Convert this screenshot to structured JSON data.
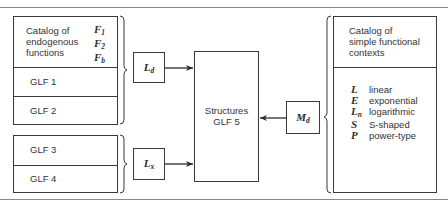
{
  "left_group_1": {
    "catalog": {
      "label_lines": [
        "Catalog of",
        "endogenous",
        "functions"
      ],
      "symbols": [
        {
          "base": "F",
          "sub": "1"
        },
        {
          "base": "F",
          "sub": "2"
        },
        {
          "base": "F",
          "sub": "b"
        }
      ]
    },
    "glf1": "GLF 1",
    "glf2": "GLF 2"
  },
  "left_group_2": {
    "glf3": "GLF 3",
    "glf4": "GLF 4"
  },
  "ld_box": {
    "base": "L",
    "sub": "d"
  },
  "lx_box": {
    "base": "L",
    "sub": "x"
  },
  "md_box": {
    "base": "M",
    "sub": "d"
  },
  "center_box": {
    "line1": "Structures",
    "line2": "GLF 5"
  },
  "right_box": {
    "title_lines": [
      "Catalog of",
      "simple functional",
      "contexts"
    ],
    "items": [
      {
        "symbol": "L",
        "sub": "",
        "label": "linear"
      },
      {
        "symbol": "E",
        "sub": "",
        "label": "exponential"
      },
      {
        "symbol": "L",
        "sub": "n",
        "label": "logarithmic"
      },
      {
        "symbol": "S",
        "sub": "",
        "label": "S-shaped"
      },
      {
        "symbol": "P",
        "sub": "",
        "label": "power-type"
      }
    ]
  },
  "colors": {
    "line": "#3a3a3a",
    "rule": "#8a8a8a",
    "text": "#333333"
  }
}
